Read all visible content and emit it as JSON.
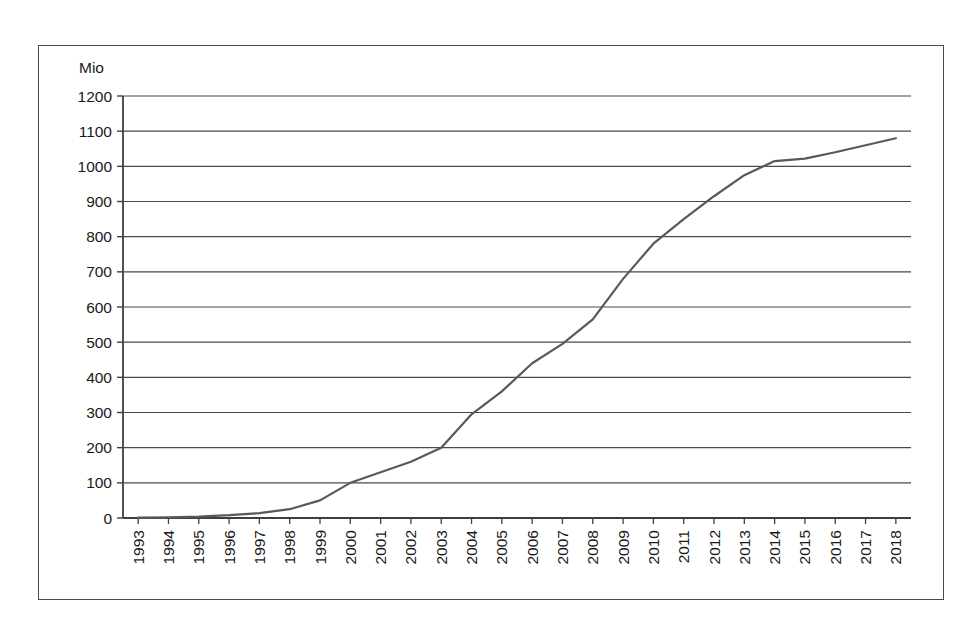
{
  "chart_data": {
    "type": "line",
    "title": "",
    "xlabel": "",
    "ylabel": "Mio",
    "unit_label": "Mio",
    "ylim": [
      0,
      1200
    ],
    "ytick_step": 100,
    "grid": true,
    "legend": false,
    "legend_position": "none",
    "line_color": "#595959",
    "categories": [
      "1993",
      "1994",
      "1995",
      "1996",
      "1997",
      "1998",
      "1999",
      "2000",
      "2001",
      "2002",
      "2003",
      "2004",
      "2005",
      "2006",
      "2007",
      "2008",
      "2009",
      "2010",
      "2011",
      "2012",
      "2013",
      "2014",
      "2015",
      "2016",
      "2017",
      "2018"
    ],
    "values": [
      1,
      2,
      4,
      8,
      14,
      25,
      50,
      100,
      130,
      160,
      200,
      295,
      360,
      440,
      495,
      565,
      680,
      780,
      850,
      915,
      975,
      1015,
      1022,
      1040,
      1060,
      1080
    ],
    "ytick_labels": [
      "1200",
      "1100",
      "1000",
      "900",
      "800",
      "700",
      "600",
      "500",
      "400",
      "300",
      "200",
      "100",
      "0"
    ],
    "ytick_values": [
      1200,
      1100,
      1000,
      900,
      800,
      700,
      600,
      500,
      400,
      300,
      200,
      100,
      0
    ]
  }
}
